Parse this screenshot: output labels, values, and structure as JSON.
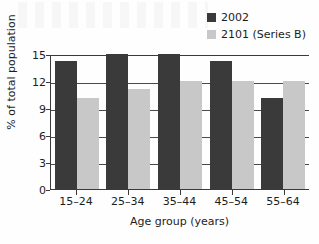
{
  "chart_data": {
    "type": "bar",
    "title": "",
    "subtitle": "",
    "xlabel": "Age group (years)",
    "ylabel": "% of total population",
    "categories": [
      "15–24",
      "25–34",
      "35–44",
      "45–54",
      "55–64"
    ],
    "series": [
      {
        "name": "2002",
        "color": "#3a3a3a",
        "values": [
          14.2,
          15.0,
          15.0,
          14.2,
          10.1
        ]
      },
      {
        "name": "2101 (Series B)",
        "color": "#c8c8c8",
        "values": [
          10.1,
          11.1,
          12.0,
          12.0,
          12.0
        ]
      }
    ],
    "ylim": [
      0,
      15
    ],
    "yticks": [
      0,
      3,
      6,
      9,
      12,
      15
    ],
    "ytick_labels": [
      "0",
      "3",
      "6",
      "9",
      "12",
      "15"
    ],
    "grid": "horizontal",
    "legend_position": "top-right"
  },
  "legend": {
    "entries": [
      {
        "label": "2002",
        "color": "#3a3a3a"
      },
      {
        "label": "2101 (Series B)",
        "color": "#c8c8c8"
      }
    ]
  }
}
